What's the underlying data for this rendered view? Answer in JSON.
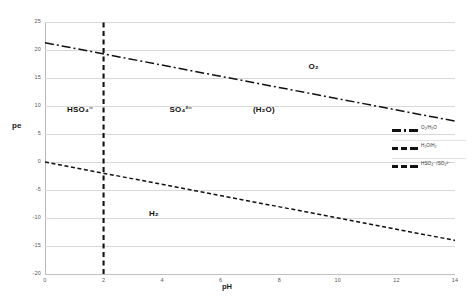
{
  "chart_data": {
    "type": "line",
    "title": "",
    "xlabel": "pH",
    "ylabel": "pe",
    "xlim": [
      0,
      14
    ],
    "ylim": [
      -20,
      25
    ],
    "xticks": [
      "0",
      "2",
      "4",
      "6",
      "8",
      "10",
      "12",
      "14"
    ],
    "yticks": [
      "25",
      "20",
      "15",
      "10",
      "5",
      "0",
      "-5",
      "-10",
      "-15",
      "-20"
    ],
    "grid": "horizontal",
    "legend_position": "right-middle",
    "series": [
      {
        "name": "O2/H2O",
        "legend_label": "O₂/H₂O",
        "style": "dash-dot",
        "color": "#111111",
        "x": [
          0,
          14
        ],
        "y": [
          21.3,
          7.3
        ]
      },
      {
        "name": "H2O/H2",
        "legend_label": "H₂O/H₂",
        "style": "dashed",
        "color": "#111111",
        "x": [
          0,
          14
        ],
        "y": [
          0.0,
          -14.0
        ]
      },
      {
        "name": "HSO4-/SO42-",
        "legend_label": "HSO₄⁻/SO₄²⁻",
        "style": "dashed-vertical",
        "color": "#111111",
        "x": [
          2,
          2
        ],
        "y": [
          -20,
          25
        ]
      }
    ],
    "annotations": [
      {
        "text": "O₂",
        "x": 9.0,
        "y": 17.0
      },
      {
        "text": "(H₂O)",
        "x": 7.1,
        "y": 9.2
      },
      {
        "text": "H₂",
        "x": 3.55,
        "y": -9.2
      },
      {
        "text": "HSO₄⁻",
        "x": 0.75,
        "y": 9.2
      },
      {
        "text": "SO₄²⁻",
        "x": 4.25,
        "y": 9.2
      }
    ]
  },
  "axis": {
    "y_title": "pe",
    "x_title": "pH"
  }
}
